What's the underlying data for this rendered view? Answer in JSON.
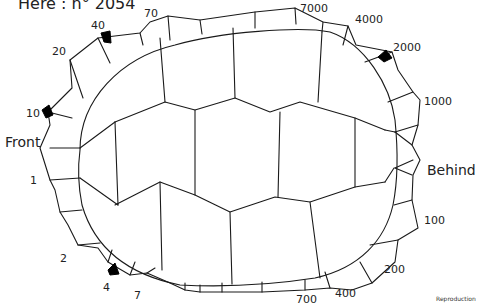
{
  "title": "Here : n° 2054",
  "orientation": {
    "front": "Front",
    "behind": "Behind"
  },
  "marginal_labels": {
    "left_front": [
      "70",
      "40",
      "20",
      "10",
      "1",
      "2",
      "4",
      "7"
    ],
    "right_rear": [
      "7000",
      "4000",
      "2000",
      "1000",
      "100",
      "200",
      "400",
      "700"
    ]
  },
  "labels": [
    {
      "id": "l70",
      "text": "70"
    },
    {
      "id": "l40",
      "text": "40"
    },
    {
      "id": "l20",
      "text": "20"
    },
    {
      "id": "l10",
      "text": "10"
    },
    {
      "id": "l1",
      "text": "1"
    },
    {
      "id": "l2",
      "text": "2"
    },
    {
      "id": "l4",
      "text": "4"
    },
    {
      "id": "l7",
      "text": "7"
    },
    {
      "id": "l7000",
      "text": "7000"
    },
    {
      "id": "l4000",
      "text": "4000"
    },
    {
      "id": "l2000",
      "text": "2000"
    },
    {
      "id": "l1000",
      "text": "1000"
    },
    {
      "id": "l100",
      "text": "100"
    },
    {
      "id": "l200",
      "text": "200"
    },
    {
      "id": "l400",
      "text": "400"
    },
    {
      "id": "l700",
      "text": "700"
    }
  ],
  "marked_scutes": [
    "40",
    "10",
    "4",
    "2000"
  ],
  "mark_color": "#000000",
  "line_color": "#1a1a1a",
  "credit": "Reproduction"
}
